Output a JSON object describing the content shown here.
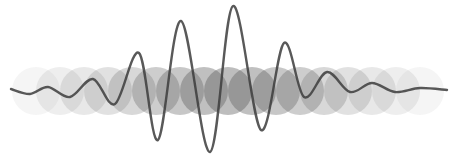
{
  "illustration": {
    "width": 455,
    "height": 164,
    "background": "#ffffff",
    "circles": {
      "color": "#5a5a5a",
      "radius": 24,
      "center_y": 91,
      "items": [
        {
          "cx": 36,
          "opacity": 0.06
        },
        {
          "cx": 60,
          "opacity": 0.1
        },
        {
          "cx": 84,
          "opacity": 0.14
        },
        {
          "cx": 108,
          "opacity": 0.18
        },
        {
          "cx": 132,
          "opacity": 0.24
        },
        {
          "cx": 156,
          "opacity": 0.3
        },
        {
          "cx": 180,
          "opacity": 0.34
        },
        {
          "cx": 204,
          "opacity": 0.38
        },
        {
          "cx": 228,
          "opacity": 0.4
        },
        {
          "cx": 252,
          "opacity": 0.38
        },
        {
          "cx": 276,
          "opacity": 0.34
        },
        {
          "cx": 300,
          "opacity": 0.3
        },
        {
          "cx": 324,
          "opacity": 0.24
        },
        {
          "cx": 348,
          "opacity": 0.18
        },
        {
          "cx": 372,
          "opacity": 0.14
        },
        {
          "cx": 396,
          "opacity": 0.1
        },
        {
          "cx": 420,
          "opacity": 0.06
        }
      ]
    },
    "wave": {
      "color": "#3c3c3c",
      "stroke_width": 2.4,
      "opacity": 0.85,
      "points": [
        [
          11,
          89
        ],
        [
          30,
          94
        ],
        [
          48,
          87
        ],
        [
          70,
          97
        ],
        [
          93,
          79
        ],
        [
          115,
          104
        ],
        [
          139,
          53
        ],
        [
          158,
          140
        ],
        [
          181,
          21
        ],
        [
          210,
          152
        ],
        [
          233,
          6
        ],
        [
          261,
          130
        ],
        [
          284,
          43
        ],
        [
          304,
          97
        ],
        [
          327,
          72
        ],
        [
          350,
          92
        ],
        [
          372,
          83
        ],
        [
          395,
          92
        ],
        [
          420,
          88
        ],
        [
          447,
          90
        ]
      ]
    }
  }
}
